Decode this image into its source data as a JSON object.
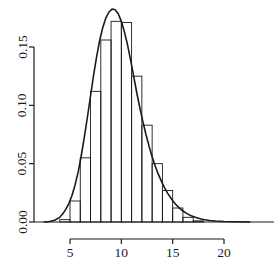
{
  "chart_data": {
    "type": "bar",
    "title": "",
    "subtitle": "",
    "xlabel": "",
    "ylabel": "",
    "xlim": [
      2.2,
      24.0
    ],
    "ylim": [
      0.0,
      0.186
    ],
    "grid": false,
    "legend": null,
    "x_tick_labels": [
      "5",
      "10",
      "15",
      "20"
    ],
    "x_tick_values": [
      5,
      10,
      15,
      20
    ],
    "y_tick_labels": [
      "0.00",
      "0.05",
      "0.10",
      "0.15"
    ],
    "y_tick_values": [
      0.0,
      0.05,
      0.1,
      0.15
    ],
    "bin_width": 1,
    "bin_edges": [
      3,
      4,
      5,
      6,
      7,
      8,
      9,
      10,
      11,
      12,
      13,
      14,
      15,
      16,
      17,
      18
    ],
    "categories": [
      "3-4",
      "4-5",
      "5-6",
      "6-7",
      "7-8",
      "8-9",
      "9-10",
      "10-11",
      "11-12",
      "12-13",
      "13-14",
      "14-15",
      "15-16",
      "16-17",
      "17-18"
    ],
    "values": [
      0.0,
      0.002,
      0.018,
      0.055,
      0.112,
      0.156,
      0.172,
      0.171,
      0.125,
      0.083,
      0.05,
      0.027,
      0.012,
      0.004,
      0.001
    ],
    "series": [
      {
        "name": "histogram",
        "type": "bar",
        "values": [
          0.0,
          0.002,
          0.018,
          0.055,
          0.112,
          0.156,
          0.172,
          0.171,
          0.125,
          0.083,
          0.05,
          0.027,
          0.012,
          0.004,
          0.001
        ]
      },
      {
        "name": "density-curve",
        "type": "line",
        "x": [
          2.5,
          3.0,
          3.5,
          4.0,
          4.3,
          4.6,
          4.9,
          5.2,
          5.5,
          5.8,
          6.1,
          6.4,
          6.7,
          7.0,
          7.3,
          7.6,
          7.9,
          8.2,
          8.5,
          8.8,
          9.1,
          9.4,
          9.7,
          10.0,
          10.3,
          10.6,
          10.9,
          11.2,
          11.5,
          11.8,
          12.1,
          12.4,
          12.7,
          13.0,
          13.3,
          13.6,
          13.9,
          14.2,
          14.5,
          14.8,
          15.1,
          15.4,
          15.7,
          16.0,
          16.4,
          16.8,
          17.2,
          17.6,
          18.0,
          18.6,
          19.2,
          20.0,
          21.0,
          22.5
        ],
        "y": [
          0.0,
          0.0005,
          0.0015,
          0.004,
          0.007,
          0.011,
          0.016,
          0.023,
          0.032,
          0.043,
          0.057,
          0.073,
          0.09,
          0.108,
          0.126,
          0.142,
          0.156,
          0.167,
          0.175,
          0.18,
          0.1825,
          0.182,
          0.1785,
          0.172,
          0.163,
          0.152,
          0.139,
          0.125,
          0.111,
          0.098,
          0.086,
          0.075,
          0.065,
          0.056,
          0.048,
          0.041,
          0.035,
          0.0295,
          0.0248,
          0.0208,
          0.0172,
          0.0142,
          0.0116,
          0.0094,
          0.0072,
          0.0054,
          0.004,
          0.003,
          0.0022,
          0.0013,
          0.0008,
          0.0004,
          0.0002,
          0.0
        ]
      }
    ],
    "colors": {
      "axis": "#1a1a1a",
      "bar_stroke": "#1a1a1a",
      "bar_fill": "none",
      "curve": "#1a1a1a",
      "background": "#ffffff"
    }
  },
  "axes": {
    "y_axis_name": "density-axis",
    "x_axis_name": "value-axis"
  }
}
